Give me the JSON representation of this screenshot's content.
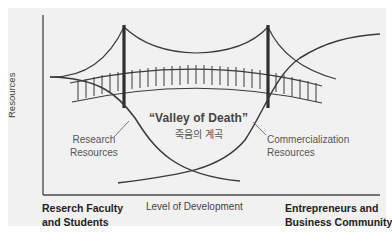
{
  "diagram": {
    "title": "Valley of Death",
    "y_axis_label": "Resources",
    "x_axis_label": "Level of Development",
    "center_label": "“Valley of Death”",
    "center_label_korean": "죽음의 계곡",
    "research_curve_label": {
      "line1": "Research",
      "line2": "Resources"
    },
    "commercialization_curve_label": {
      "line1": "Commercialization",
      "line2": "Resources"
    },
    "left_group": {
      "line1": "Reserch Faculty",
      "line2": "and Students"
    },
    "right_group": {
      "line1": "Entrepreneurs and",
      "line2": "Business Community"
    },
    "icons": [
      "suspension-bridge-icon"
    ],
    "colors": {
      "background": "#f1f1f1",
      "line": "#3a3a3a",
      "tower": "#2e2e2e",
      "text": "#333333"
    }
  }
}
